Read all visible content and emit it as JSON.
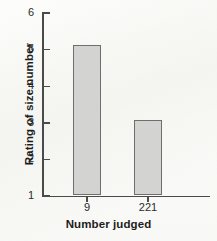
{
  "chart_data": {
    "type": "bar",
    "title": "",
    "xlabel": "Number judged",
    "ylabel": "Rating of size number",
    "categories": [
      "9",
      "221"
    ],
    "values": [
      5.1,
      3.05
    ],
    "ylim": [
      1,
      6
    ],
    "yticks": [
      1,
      2,
      3,
      4,
      5,
      6
    ],
    "ytick_labels": [
      "1",
      "2",
      "3",
      "4",
      "5",
      "6"
    ],
    "grid": false,
    "legend": null,
    "series": [
      {
        "name": "Rating of size number",
        "values": [
          5.1,
          3.05
        ],
        "bar_fill_color": "#d3d3d2",
        "bar_edge_color": "#6e6e6e"
      }
    ],
    "annotations": []
  },
  "figure": {
    "background_color": "#fdfdfb",
    "axis_color": "#4a4a4a",
    "text_color": "#1d1d1d"
  }
}
